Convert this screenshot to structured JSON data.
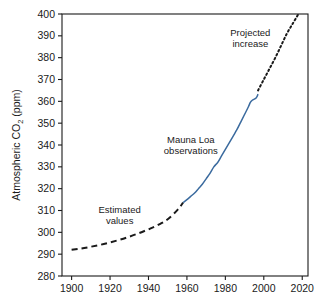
{
  "chart_data": {
    "type": "line",
    "title": "",
    "xlabel": "",
    "ylabel": "Atmospheric CO2 (ppm)",
    "ylabel_main": "Atmospheric CO",
    "ylabel_sub": "2",
    "ylabel_unit": " (ppm)",
    "xlim": [
      1895,
      2023
    ],
    "ylim": [
      280,
      400
    ],
    "xticks": [
      1900,
      1920,
      1940,
      1960,
      1980,
      2000,
      2020
    ],
    "xtick_labels": [
      "1900",
      "1920",
      "1940",
      "1960",
      "1980",
      "2000",
      "2020"
    ],
    "yticks": [
      280,
      290,
      300,
      310,
      320,
      330,
      340,
      350,
      360,
      370,
      380,
      390,
      400
    ],
    "ytick_labels": [
      "280",
      "290",
      "300",
      "310",
      "320",
      "330",
      "340",
      "350",
      "360",
      "370",
      "380",
      "390",
      "400"
    ],
    "grid": false,
    "legend_position": "none",
    "series": [
      {
        "name": "Estimated values",
        "style": "dashed",
        "color": "#1a1a1a",
        "x": [
          1900,
          1905,
          1910,
          1915,
          1920,
          1925,
          1930,
          1935,
          1940,
          1945,
          1950,
          1955,
          1958
        ],
        "values": [
          292.0,
          292.6,
          293.4,
          294.3,
          295.4,
          296.6,
          298.0,
          299.6,
          301.4,
          303.4,
          306.0,
          310.2,
          313.6
        ]
      },
      {
        "name": "Mauna Loa observations",
        "style": "solid",
        "color": "#3a6a9e",
        "x": [
          1958,
          1960,
          1962,
          1964,
          1966,
          1968,
          1970,
          1972,
          1974,
          1976,
          1978,
          1980,
          1982,
          1984,
          1986,
          1988,
          1990,
          1992,
          1993,
          1994,
          1996,
          1997
        ],
        "values": [
          313.6,
          315.0,
          316.5,
          318.0,
          320.0,
          322.0,
          324.5,
          327.0,
          330.0,
          332.0,
          335.0,
          338.0,
          341.0,
          344.0,
          347.0,
          350.5,
          354.0,
          357.5,
          359.5,
          360.5,
          361.5,
          363.3
        ]
      },
      {
        "name": "Projected increase",
        "style": "dotted",
        "color": "#1a1a1a",
        "x": [
          1997,
          2000,
          2003,
          2006,
          2009,
          2012,
          2015,
          2018
        ],
        "values": [
          365.0,
          370.0,
          375.0,
          380.0,
          385.5,
          391.0,
          395.5,
          400.0
        ]
      }
    ],
    "annotations": [
      {
        "id": "estimated-values",
        "line1": "Estimated",
        "line2": "values",
        "x": 1925,
        "y": 309
      },
      {
        "id": "mauna-loa-observations",
        "line1": "Mauna Loa",
        "line2": "observations",
        "x": 1962,
        "y": 341
      },
      {
        "id": "projected-increase",
        "line1": "Projected",
        "line2": "increase",
        "x": 1993,
        "y": 390
      }
    ]
  }
}
